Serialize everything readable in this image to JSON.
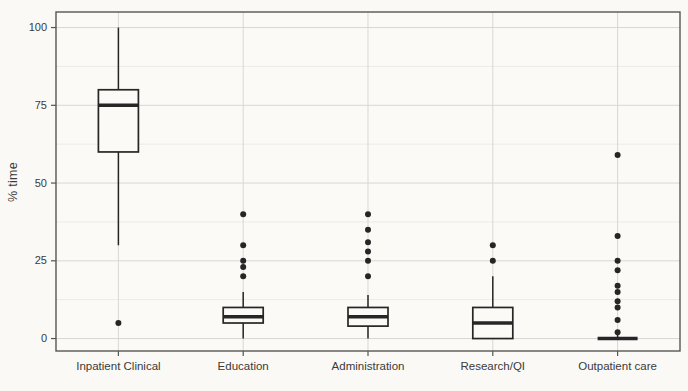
{
  "figure": {
    "background": "#faf9f6",
    "colors": {
      "stroke": "#262626",
      "text": "#3a3a3a",
      "tick": "#555555",
      "grid_major": "#d7d7d5",
      "grid_minor": "#ebebe9",
      "panel_border": "#565656",
      "panel_bg": "#fbfaf7"
    }
  },
  "chart_data": {
    "type": "boxplot",
    "title": "",
    "xlabel": "",
    "ylabel": "% time",
    "ylim": [
      -4,
      105
    ],
    "yticks": [
      0,
      25,
      50,
      75,
      100
    ],
    "yminor": [
      12.5,
      37.5,
      62.5,
      87.5
    ],
    "grid": true,
    "legend": "none",
    "categories": [
      "Inpatient Clinical",
      "Education",
      "Administration",
      "Research/QI",
      "Outpatient care"
    ],
    "boxes": [
      {
        "category": "Inpatient Clinical",
        "whisker_low": 30,
        "q1": 60,
        "median": 75,
        "q3": 80,
        "whisker_high": 100,
        "outliers": [
          5
        ]
      },
      {
        "category": "Education",
        "whisker_low": 0,
        "q1": 5,
        "median": 7,
        "q3": 10,
        "whisker_high": 15,
        "outliers": [
          20,
          23,
          25,
          30,
          40
        ]
      },
      {
        "category": "Administration",
        "whisker_low": 0,
        "q1": 4,
        "median": 7,
        "q3": 10,
        "whisker_high": 14,
        "outliers": [
          20,
          25,
          28,
          31,
          35,
          40
        ]
      },
      {
        "category": "Research/QI",
        "whisker_low": 0,
        "q1": 0,
        "median": 5,
        "q3": 10,
        "whisker_high": 20,
        "outliers": [
          25,
          30
        ]
      },
      {
        "category": "Outpatient care",
        "whisker_low": 0,
        "q1": 0,
        "median": 0,
        "q3": 0,
        "whisker_high": 2,
        "outliers": [
          2,
          6,
          10,
          12,
          15,
          17,
          22,
          25,
          33,
          59
        ]
      }
    ]
  }
}
